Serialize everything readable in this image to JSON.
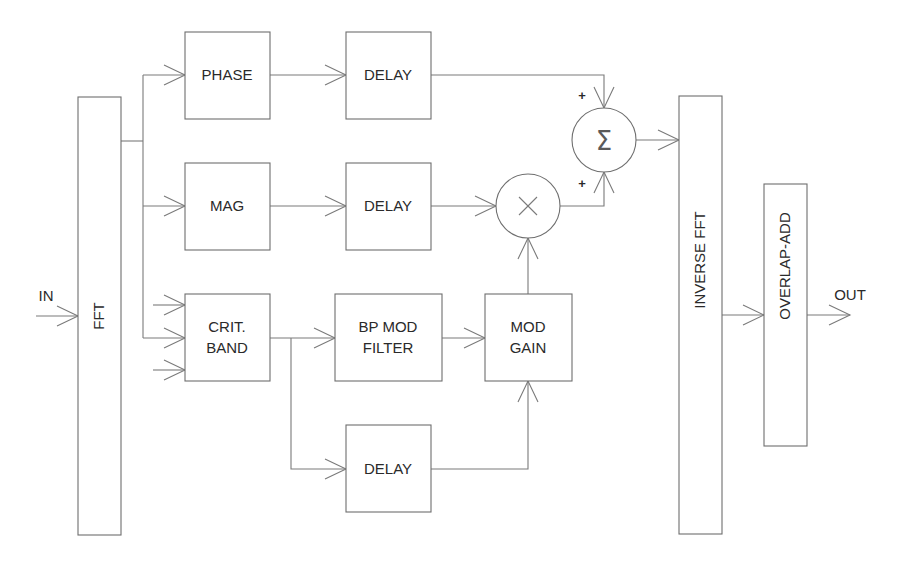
{
  "diagram": {
    "type": "signal-processing-block-diagram",
    "colors": {
      "stroke": "#6e6e6e",
      "text": "#2a2a2a",
      "background": "#ffffff"
    },
    "io": {
      "input_label": "IN",
      "output_label": "OUT"
    },
    "blocks": {
      "fft": "FFT",
      "phase": "PHASE",
      "delay_phase": "DELAY",
      "mag": "MAG",
      "delay_mag": "DELAY",
      "crit_band_line1": "CRIT.",
      "crit_band_line2": "BAND",
      "bp_mod_filter_line1": "BP MOD",
      "bp_mod_filter_line2": "FILTER",
      "mod_gain_line1": "MOD",
      "mod_gain_line2": "GAIN",
      "delay_bottom": "DELAY",
      "inverse_fft": "INVERSE FFT",
      "overlap_add": "OVERLAP-ADD"
    },
    "nodes": {
      "multiplier_symbol": "×",
      "summer_symbol": "Σ",
      "summer_input_sign_top": "+",
      "summer_input_sign_bottom": "+"
    },
    "connections": [
      {
        "from": "IN",
        "to": "FFT"
      },
      {
        "from": "FFT",
        "to": "PHASE"
      },
      {
        "from": "FFT",
        "to": "MAG"
      },
      {
        "from": "FFT",
        "to": "CRIT. BAND"
      },
      {
        "from": "PHASE",
        "to": "DELAY (phase)"
      },
      {
        "from": "MAG",
        "to": "DELAY (mag)"
      },
      {
        "from": "DELAY (mag)",
        "to": "multiplier"
      },
      {
        "from": "CRIT. BAND",
        "to": "BP MOD FILTER"
      },
      {
        "from": "CRIT. BAND",
        "to": "DELAY (bottom)"
      },
      {
        "from": "BP MOD FILTER",
        "to": "MOD GAIN"
      },
      {
        "from": "DELAY (bottom)",
        "to": "MOD GAIN"
      },
      {
        "from": "MOD GAIN",
        "to": "multiplier"
      },
      {
        "from": "DELAY (phase)",
        "to": "summer",
        "sign": "+"
      },
      {
        "from": "multiplier",
        "to": "summer",
        "sign": "+"
      },
      {
        "from": "summer",
        "to": "INVERSE FFT"
      },
      {
        "from": "INVERSE FFT",
        "to": "OVERLAP-ADD"
      },
      {
        "from": "OVERLAP-ADD",
        "to": "OUT"
      }
    ]
  }
}
